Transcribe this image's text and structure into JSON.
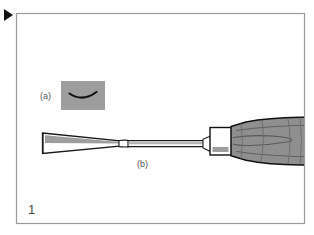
{
  "figure": {
    "number": "1",
    "marker_icon": "play-triangle-icon",
    "frame": {
      "border_color": "#9a9a9a",
      "background_color": "#ffffff",
      "x": 16,
      "y": 13,
      "width": 289,
      "height": 211
    },
    "labels": [
      {
        "id": "a",
        "text": "(a)",
        "x": 40,
        "y": 92
      },
      {
        "id": "b",
        "text": "(b)",
        "x": 137,
        "y": 160
      }
    ],
    "inset": {
      "name": "cross-section-inset",
      "description": "gray box containing curved blade cross-section profile",
      "fill_color": "#9d9d9d",
      "stroke_color": "#111111",
      "x": 61,
      "y": 81,
      "width": 44,
      "height": 29
    },
    "tool": {
      "name": "wood-gouge-chisel",
      "parts": [
        {
          "name": "blade",
          "fill_color": "#ffffff",
          "stroke_color": "#1a1a1a",
          "flute_color": "#9d9d9d"
        },
        {
          "name": "shaft",
          "fill_color": "#ffffff",
          "stroke_color": "#1a1a1a",
          "flute_color": "#b4b4b4"
        },
        {
          "name": "ferrule",
          "fill_color": "#ffffff",
          "stroke_color": "#111111",
          "band_color": "#9d9d9d"
        },
        {
          "name": "handle",
          "fill_color": "#8f8f8f",
          "stroke_color": "#111111",
          "grain_color": "#5a5a5a"
        }
      ]
    }
  }
}
